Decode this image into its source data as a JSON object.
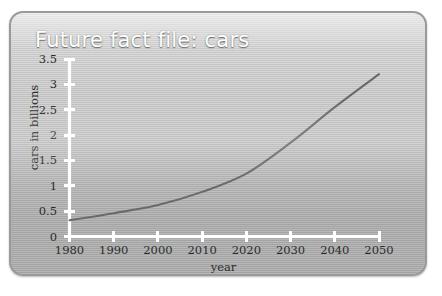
{
  "figure": {
    "title": "Future fact file: cars",
    "title_color": "#ffffff",
    "panel_color": "#c2c2c2",
    "axis_color": "#ffffff",
    "line_color": "#6a6a6a"
  },
  "chart_data": {
    "type": "line",
    "title": "Future fact file: cars",
    "xlabel": "year",
    "ylabel": "cars in billions",
    "xlim": [
      1980,
      2050
    ],
    "ylim": [
      0,
      3.5
    ],
    "xticks": [
      1980,
      1990,
      2000,
      2010,
      2020,
      2030,
      2040,
      2050
    ],
    "xtick_labels": [
      "1980",
      "1990",
      "2000",
      "2010",
      "2020",
      "2030",
      "2040",
      "2050"
    ],
    "yticks": [
      0,
      0.5,
      1,
      1.5,
      2,
      2.5,
      3,
      3.5
    ],
    "ytick_labels": [
      "0",
      "0.5",
      "1",
      "1.5",
      "2",
      "2.5",
      "3",
      "3.5"
    ],
    "grid": false,
    "legend": null,
    "series": [
      {
        "name": "cars in billions",
        "color": "#6a6a6a",
        "x": [
          1980,
          1990,
          2000,
          2010,
          2020,
          2030,
          2040,
          2050
        ],
        "values": [
          0.32,
          0.46,
          0.62,
          0.88,
          1.24,
          1.85,
          2.55,
          3.2
        ]
      }
    ]
  }
}
